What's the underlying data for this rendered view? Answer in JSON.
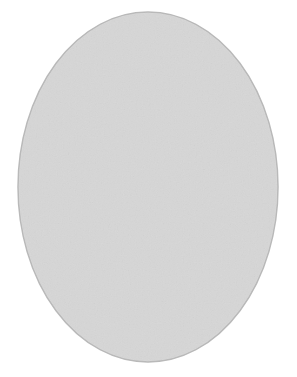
{
  "figure": {
    "caption": "",
    "canvas": {
      "width": 297,
      "height": 377,
      "background": "#ffffff"
    }
  },
  "cell": {
    "label": "cell-body",
    "shape": "oval",
    "center_x": 148,
    "center_y": 187,
    "radius_x": 130,
    "radius_y": 175,
    "fill_color": "#dcdcdc",
    "stroke_color": "#b9b9b9",
    "stroke_width": 1.5
  },
  "poles": [
    {
      "name": "top-pole-centrosome",
      "label": "Centrosome (top pole)",
      "cx": 151,
      "cy": 50,
      "outer_r": 7.2,
      "inner_r": 4.2,
      "ring_color": "#1c1c1c",
      "core_color": "#ffffff"
    },
    {
      "name": "bottom-pole-centrosome",
      "label": "Centrosome (bottom pole)",
      "cx": 147,
      "cy": 333,
      "outer_r": 7.2,
      "inner_r": 4.2,
      "ring_color": "#1c1c1c",
      "core_color": "#ffffff"
    }
  ],
  "spindle": {
    "label": "spindle-apparatus",
    "fiber_color": "#5a5a5a",
    "fiber_dash": "1.6 4.6",
    "fiber_width": 1.7,
    "fiber_count": 5,
    "aster_color": "#6e6e6e",
    "aster_dash": "1.5 4.4",
    "aster_width": 1.6,
    "fibers": [
      {
        "name": "spindle-fiber-1",
        "bow": -88
      },
      {
        "name": "spindle-fiber-2",
        "bow": -46
      },
      {
        "name": "spindle-fiber-3",
        "bow": -8
      },
      {
        "name": "spindle-fiber-4",
        "bow": 34
      },
      {
        "name": "spindle-fiber-5",
        "bow": 74
      }
    ],
    "top_asters": [
      {
        "name": "aster-ray-top-1",
        "dx": -92,
        "dy": -6
      },
      {
        "name": "aster-ray-top-2",
        "dx": -74,
        "dy": -28
      },
      {
        "name": "aster-ray-top-3",
        "dx": -46,
        "dy": -42
      },
      {
        "name": "aster-ray-top-4",
        "dx": -12,
        "dy": -47
      },
      {
        "name": "aster-ray-top-5",
        "dx": 22,
        "dy": -42
      },
      {
        "name": "aster-ray-top-6",
        "dx": 52,
        "dy": -26
      },
      {
        "name": "aster-ray-top-7",
        "dx": 86,
        "dy": -4
      }
    ],
    "bottom_asters": [
      {
        "name": "aster-ray-bottom-1",
        "dx": -96,
        "dy": 4
      },
      {
        "name": "aster-ray-bottom-2",
        "dx": -76,
        "dy": 26
      },
      {
        "name": "aster-ray-bottom-3",
        "dx": -44,
        "dy": 40
      },
      {
        "name": "aster-ray-bottom-4",
        "dx": -8,
        "dy": 44
      },
      {
        "name": "aster-ray-bottom-5",
        "dx": 26,
        "dy": 38
      },
      {
        "name": "aster-ray-bottom-6",
        "dx": 58,
        "dy": 22
      },
      {
        "name": "aster-ray-bottom-7",
        "dx": 92,
        "dy": 2
      }
    ]
  },
  "chromosomes": [
    {
      "name": "chromosome-upper-left",
      "label": "Chromosome 1 (upper left)",
      "cx": 75,
      "cy": 164,
      "arm_length": 44,
      "arm_width": 13,
      "spread_deg": 17,
      "rotation_deg": 0,
      "fill_color": "#55585a",
      "stroke_color": "#141414",
      "centromere_color": "#f6f6f6"
    },
    {
      "name": "chromosome-upper-right",
      "label": "Chromosome 2 (upper right)",
      "cx": 174,
      "cy": 165,
      "arm_length": 42,
      "arm_width": 12.5,
      "spread_deg": 16,
      "rotation_deg": 0,
      "fill_color": "#2a2c2e",
      "stroke_color": "#0d0d0d",
      "centromere_color": "#f6f6f6"
    },
    {
      "name": "chromosome-lower-left",
      "label": "Chromosome 3 (lower left)",
      "cx": 104,
      "cy": 211,
      "arm_length": 44,
      "arm_width": 13,
      "spread_deg": 17,
      "rotation_deg": 0,
      "fill_color": "#35383a",
      "stroke_color": "#0d0d0d",
      "centromere_color": "#f6f6f6"
    },
    {
      "name": "chromosome-lower-right",
      "label": "Chromosome 4 (lower right)",
      "cx": 229,
      "cy": 214,
      "arm_length": 41,
      "arm_width": 12.5,
      "spread_deg": 16,
      "rotation_deg": 0,
      "fill_color": "#8b8d8f",
      "stroke_color": "#1a1a1a",
      "centromere_color": "#f6f6f6"
    }
  ]
}
